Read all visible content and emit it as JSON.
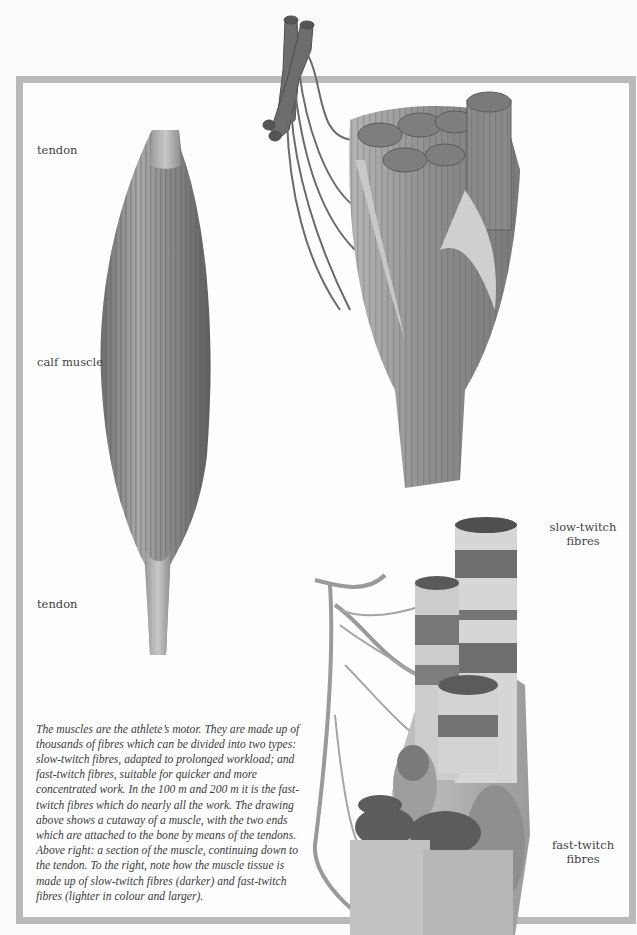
{
  "page": {
    "background": "#fbfbfb",
    "frame_color": "#b9b9b9"
  },
  "labels": {
    "tendon_top": "tendon",
    "calf_muscle": "calf muscle",
    "tendon_bottom": "tendon",
    "slow_twitch": "slow-twitch fibres",
    "fast_twitch": "fast-twitch fibres"
  },
  "caption": {
    "text": "The muscles are the athlete’s motor. They are made up of thousands of fibres which can be divided into two types: slow-twitch fibres, adapted to prolonged workload; and fast-twitch fibres, suitable for quicker and more concentrated work. In the 100 m and 200 m it is the fast-twitch fibres which do nearly all the work. The drawing above shows a cutaway of a muscle, with the two ends which are attached to the bone by means of the tendons. Above right: a section of the muscle, continuing down to the tendon. To the right, note how the muscle tissue is made up of slow-twitch fibres (darker) and fast-twitch fibres (lighter in colour and larger)."
  },
  "illustrations": [
    {
      "id": "calf-muscle",
      "description": "whole calf muscle with tendons at each end",
      "tone": "#8a8a8a"
    },
    {
      "id": "muscle-cutaway",
      "description": "cutaway of muscle showing fibre bundles, blood vessels and nerves",
      "tone": "#8f8f8f"
    },
    {
      "id": "fibre-section",
      "description": "section of muscle tissue with slow-twitch (darker banded) and fast-twitch (lighter, larger) fibres",
      "tone": "#a5a5a5"
    }
  ]
}
